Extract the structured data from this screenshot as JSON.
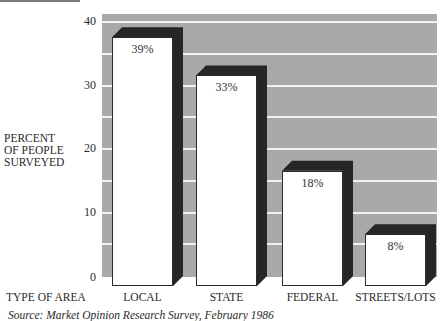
{
  "chart_data": {
    "type": "bar",
    "title": "",
    "xlabel": "TYPE OF AREA",
    "ylabel": "PERCENT OF PEOPLE SURVEYED",
    "categories": [
      "LOCAL",
      "STATE",
      "FEDERAL",
      "STREETS/LOTS"
    ],
    "values": [
      39,
      33,
      18,
      8
    ],
    "data_labels": [
      "39%",
      "33%",
      "18%",
      "8%"
    ],
    "ylim": [
      0,
      40
    ],
    "yticks": [
      0,
      10,
      20,
      30,
      40
    ],
    "grid": true,
    "legend": "none",
    "style": "3d-bar",
    "source": "Source: Market Opinion Research Survey, February 1986"
  },
  "labels": {
    "ylabel_lines": [
      "PERCENT",
      "OF PEOPLE",
      "SURVEYED"
    ],
    "xaxis_title": "TYPE OF AREA",
    "source": "Source: Market Opinion Research Survey, February 1986"
  },
  "colors": {
    "plot_background": "#a9a9a9",
    "gridline": "#f2f2f2",
    "bar_front": "#ffffff",
    "bar_shadow": "#262626"
  }
}
